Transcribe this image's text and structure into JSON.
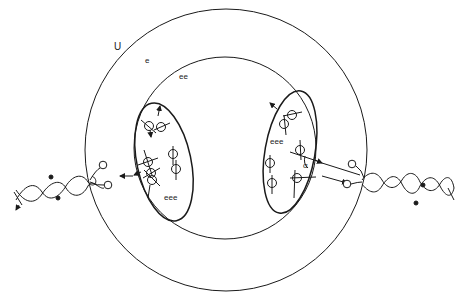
{
  "diagram": {
    "outer_region_label": "U",
    "outer_ring_label": "e",
    "inner_region_label": "ee",
    "left_cluster_label": "eee",
    "right_cluster_label": "eee",
    "angle_label": "α",
    "colors": {
      "stroke": "#1a1a1a",
      "background": "#ffffff"
    },
    "elements": [
      "outer-circle",
      "inner-circle",
      "left-ellipse-cluster",
      "right-ellipse-cluster",
      "left-dna-helix",
      "right-dna-helix"
    ]
  }
}
